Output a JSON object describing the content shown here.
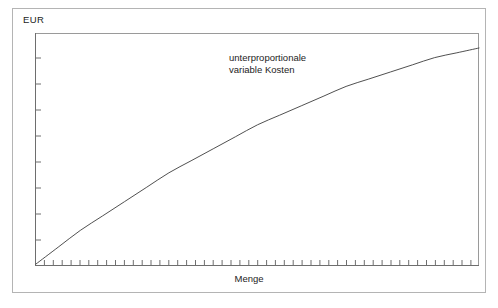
{
  "figure": {
    "y_unit_label": "EUR",
    "x_axis_label": "Menge",
    "annotation_line_1": "unterproportionale",
    "annotation_line_2": "variable Kosten",
    "border_color": "#b4b4b4",
    "axis_color": "#6e6e6e",
    "curve_color": "#3c3c3c",
    "text_color": "#1c1c1c",
    "background_color": "#ffffff"
  },
  "chart_data": {
    "type": "line",
    "title": "",
    "subtitle": "",
    "xlabel": "Menge",
    "ylabel": "EUR",
    "grid": false,
    "legend": false,
    "legend_position": "none",
    "axis_tick_labels_shown": false,
    "x_tick_count": 50,
    "y_tick_count": 9,
    "xlim": [
      0,
      100
    ],
    "ylim": [
      0,
      100
    ],
    "annotations": [
      {
        "text": "unterproportionale variable Kosten",
        "lines": [
          "unterproportionale",
          "variable Kosten"
        ],
        "x": 46,
        "y": 84
      }
    ],
    "series": [
      {
        "name": "unterproportionale variable Kosten",
        "shape": "concave-increasing-degressive",
        "color": "#3c3c3c",
        "x": [
          0,
          5,
          10,
          15,
          20,
          25,
          30,
          35,
          40,
          45,
          50,
          55,
          60,
          65,
          70,
          75,
          80,
          85,
          90,
          95,
          100
        ],
        "values": [
          0,
          7,
          14,
          20,
          26,
          32,
          38,
          43,
          48,
          53,
          58,
          62,
          66,
          70,
          74,
          77,
          80,
          83,
          86,
          88,
          90
        ]
      }
    ]
  }
}
